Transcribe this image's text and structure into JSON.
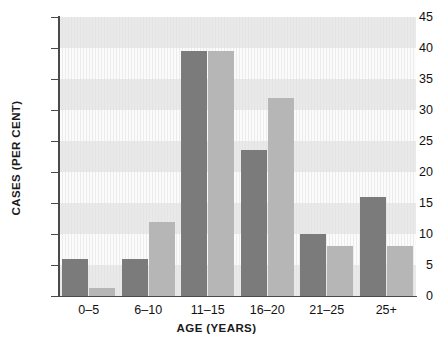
{
  "chart_data": {
    "type": "bar",
    "title": "",
    "xlabel": "AGE (YEARS)",
    "ylabel": "CASES (PER CENT)",
    "categories": [
      "0–5",
      "6–10",
      "11–15",
      "16–20",
      "21–25",
      "25+"
    ],
    "series": [
      {
        "name": "series-1",
        "color": "#7b7b7b",
        "values": [
          6,
          6,
          39.5,
          23.5,
          10,
          16
        ]
      },
      {
        "name": "series-2",
        "color": "#b6b6b6",
        "values": [
          1.3,
          12,
          39.5,
          32,
          8,
          8
        ]
      }
    ],
    "ylim": [
      0,
      45
    ],
    "ytick_values": [
      0,
      5,
      10,
      15,
      20,
      25,
      30,
      35,
      40,
      45
    ],
    "ytick_labels": [
      "0",
      "5",
      "10",
      "15",
      "20",
      "25",
      "30",
      "35",
      "40",
      "45"
    ],
    "grid": "horizontal-bands",
    "legend": "none"
  }
}
